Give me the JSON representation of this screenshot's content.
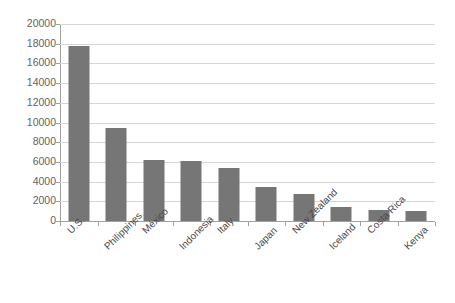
{
  "chart_data": {
    "type": "bar",
    "title": "",
    "subtitle": "",
    "xlabel": "",
    "ylabel": "",
    "categories": [
      "U.S.",
      "Philippines",
      "México",
      "Indonesia",
      "Italy",
      "Japan",
      "New Zealand",
      "Iceland",
      "Costa Rica",
      "Kenya"
    ],
    "values": [
      17800,
      9400,
      6200,
      6100,
      5350,
      3500,
      2750,
      1450,
      1150,
      1050
    ],
    "series": [
      {
        "name": "",
        "values": [
          17800,
          9400,
          6200,
          6100,
          5350,
          3500,
          2750,
          1450,
          1150,
          1050
        ]
      }
    ],
    "ylim": [
      0,
      20000
    ],
    "ytick_values": [
      0,
      2000,
      4000,
      6000,
      8000,
      10000,
      12000,
      14000,
      16000,
      18000,
      20000
    ],
    "ytick_labels": [
      "0",
      "2000",
      "4000",
      "6000",
      "8000",
      "10000",
      "12000",
      "14000",
      "16000",
      "18000",
      "20000"
    ],
    "grid": "horizontal",
    "legend": "none",
    "bar_color": "#767676",
    "gridline_color": "#d6d6d6",
    "axis_color": "#a0a0a0",
    "background_color": "#ffffff",
    "label_rotation_degrees": -45,
    "annotations": []
  }
}
